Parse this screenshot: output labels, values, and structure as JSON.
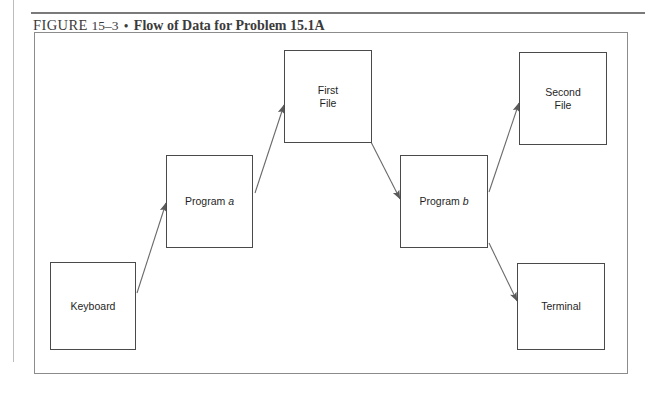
{
  "caption": {
    "figure_word": "FIGURE",
    "figure_number": "15–3",
    "separator": "•",
    "title": "Flow of Data for Problem 15.1A"
  },
  "diagram": {
    "nodes": [
      {
        "id": "keyboard",
        "label": "Keyboard",
        "label_plain": "Keyboard"
      },
      {
        "id": "program-a",
        "label": "Program ",
        "label_italic": "a",
        "label_plain": "Program a"
      },
      {
        "id": "first-file",
        "label": "First\nFile",
        "label_plain": "First File"
      },
      {
        "id": "program-b",
        "label": "Program ",
        "label_italic": "b",
        "label_plain": "Program b"
      },
      {
        "id": "second-file",
        "label": "Second\nFile",
        "label_plain": "Second File"
      },
      {
        "id": "terminal",
        "label": "Terminal",
        "label_plain": "Terminal"
      }
    ],
    "edges": [
      {
        "from": "keyboard",
        "to": "program-a",
        "direction": "up-right"
      },
      {
        "from": "program-a",
        "to": "first-file",
        "direction": "up-right"
      },
      {
        "from": "first-file",
        "to": "program-b",
        "direction": "down-right"
      },
      {
        "from": "program-b",
        "to": "second-file",
        "direction": "up-right"
      },
      {
        "from": "program-b",
        "to": "terminal",
        "direction": "down-right"
      }
    ]
  },
  "colors": {
    "line": "#4a4a4a",
    "frame": "#8c8c8c",
    "rule": "#7a7a7a",
    "text": "#1f1f1f",
    "caption_text": "#3b3b3b",
    "background": "#ffffff"
  }
}
